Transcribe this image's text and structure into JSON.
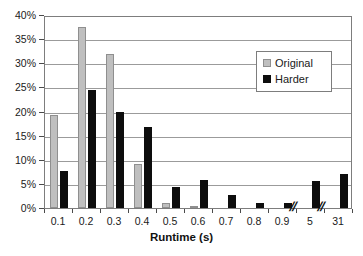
{
  "chart_data": {
    "type": "bar",
    "title": "",
    "xlabel": "Runtime (s)",
    "ylabel": "",
    "categories": [
      "0.1",
      "0.2",
      "0.3",
      "0.4",
      "0.5",
      "0.6",
      "0.7",
      "0.8",
      "0.9",
      "5",
      "31"
    ],
    "series": [
      {
        "name": "Original",
        "color": "#bfbfbf",
        "values": [
          19.2,
          37.6,
          32.0,
          9.2,
          1.0,
          0.3,
          0.0,
          0.0,
          0.0,
          0.0,
          0.0
        ]
      },
      {
        "name": "Harder",
        "color": "#0d0d0d",
        "values": [
          7.7,
          24.5,
          19.8,
          16.7,
          4.4,
          5.8,
          2.7,
          1.1,
          1.0,
          5.5,
          7.1
        ]
      }
    ],
    "ylim": [
      0,
      40
    ],
    "yticks": [
      0,
      5,
      10,
      15,
      20,
      25,
      30,
      35,
      40
    ],
    "ytick_labels": [
      "0%",
      "5%",
      "10%",
      "15%",
      "20%",
      "25%",
      "30%",
      "35%",
      "40%"
    ],
    "grid": true,
    "legend_position": "upper right",
    "axis_breaks": [
      {
        "after_category": "0.9",
        "symbol": "//"
      },
      {
        "after_category": "5",
        "symbol": "//"
      }
    ]
  },
  "legend": {
    "items": [
      {
        "label": "Original",
        "swatch": "light-gray-square"
      },
      {
        "label": "Harder",
        "swatch": "black-square"
      }
    ]
  },
  "axes": {
    "x_title": "Runtime (s)"
  },
  "colors": {
    "original": "#bfbfbf",
    "harder": "#0d0d0d",
    "grid": "#9b9b9b",
    "frame": "#7d7d7d",
    "background": "#ffffff",
    "text": "#1a1a1a"
  }
}
